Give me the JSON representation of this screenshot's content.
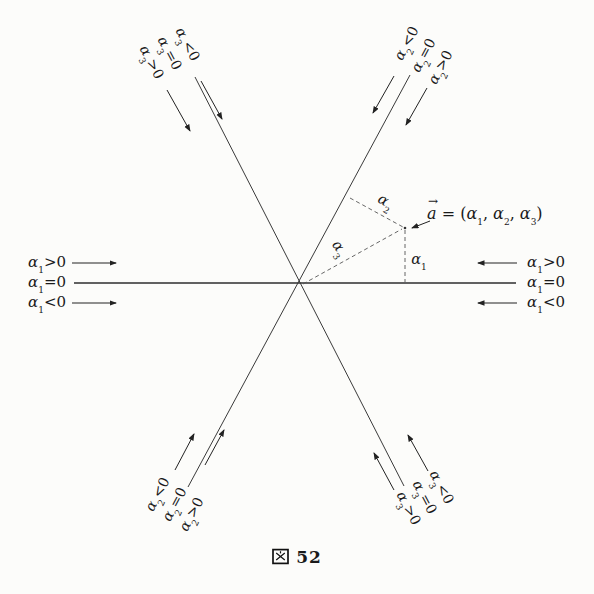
{
  "caption": {
    "prefix": "図",
    "number": "52"
  },
  "vector_label": {
    "letter": "a",
    "arrow_mark": "→",
    "eq": " = (",
    "c1_sym": "α",
    "c1_sub": "1",
    "sep1": ", ",
    "c2_sym": "α",
    "c2_sub": "2",
    "sep2": ", ",
    "c3_sym": "α",
    "c3_sub": "3",
    "close": ")"
  },
  "projection_labels": {
    "a1_sym": "α",
    "a1_sub": "1",
    "a2_sym": "α",
    "a2_sub": "2",
    "a3_sym": "α",
    "a3_sub": "3"
  },
  "left_axis_labels": [
    {
      "sym": "α",
      "sub": "1",
      "rel": ">0"
    },
    {
      "sym": "α",
      "sub": "1",
      "rel": "=0"
    },
    {
      "sym": "α",
      "sub": "1",
      "rel": "<0"
    }
  ],
  "right_axis_labels": [
    {
      "sym": "α",
      "sub": "1",
      "rel": ">0"
    },
    {
      "sym": "α",
      "sub": "1",
      "rel": "=0"
    },
    {
      "sym": "α",
      "sub": "1",
      "rel": "<0"
    }
  ],
  "top_left_labels": [
    {
      "sym": "α",
      "sub": "3",
      "rel": ">0"
    },
    {
      "sym": "α",
      "sub": "3",
      "rel": "=0"
    },
    {
      "sym": "α",
      "sub": "3",
      "rel": "<0"
    }
  ],
  "top_right_labels": [
    {
      "sym": "α",
      "sub": "2",
      "rel": "<0"
    },
    {
      "sym": "α",
      "sub": "2",
      "rel": "=0"
    },
    {
      "sym": "α",
      "sub": "2",
      "rel": ">0"
    }
  ],
  "bottom_left_labels": [
    {
      "sym": "α",
      "sub": "2",
      "rel": "<0"
    },
    {
      "sym": "α",
      "sub": "2",
      "rel": "=0"
    },
    {
      "sym": "α",
      "sub": "2",
      "rel": ">0"
    }
  ],
  "bottom_right_labels": [
    {
      "sym": "α",
      "sub": "3",
      "rel": ">0"
    },
    {
      "sym": "α",
      "sub": "3",
      "rel": "=0"
    },
    {
      "sym": "α",
      "sub": "3",
      "rel": "<0"
    }
  ],
  "colors": {
    "line": "#3a3a3a",
    "text": "#1a1a1a",
    "dash": "#555555"
  }
}
